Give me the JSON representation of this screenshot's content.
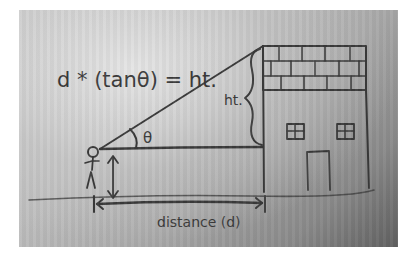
{
  "diagram": {
    "type": "hand-drawn trigonometry sketch (photograph)",
    "formula": "d * (tanθ) = ht.",
    "labels": {
      "height": "ht.",
      "angle": "θ",
      "distance": "distance (d)"
    },
    "elements": [
      {
        "name": "stick-figure",
        "description": "observer standing on ground"
      },
      {
        "name": "eye-height-arrow",
        "description": "vertical double arrow from ground to eye level"
      },
      {
        "name": "sight-line",
        "description": "line from observer's eye to top of building"
      },
      {
        "name": "horizontal-line",
        "description": "horizontal line from eye level to building"
      },
      {
        "name": "angle-arc",
        "description": "arc marking angle theta between horizontal and sight line"
      },
      {
        "name": "height-brace",
        "description": "curly brace marking height from eye level to roof"
      },
      {
        "name": "building",
        "description": "house with brick roof section, two windows and a door"
      },
      {
        "name": "ground-line",
        "description": "horizontal ground line"
      },
      {
        "name": "distance-arrow",
        "description": "double arrow from observer to building base"
      }
    ],
    "colors": {
      "ink": "#3a3a3a",
      "paper_light": "#c9c9c9",
      "paper_dark": "#606060",
      "border": "#ffffff"
    }
  }
}
